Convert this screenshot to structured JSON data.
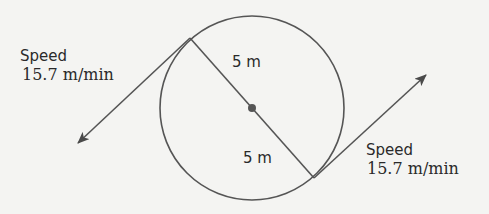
{
  "diagram": {
    "type": "circle-tangent-velocity",
    "circle": {
      "radius_label_top": "5 m",
      "radius_label_bottom": "5 m"
    },
    "left_velocity": {
      "title": "Speed",
      "value": "15.7 m/min"
    },
    "right_velocity": {
      "title": "Speed",
      "value": "15.7 m/min"
    },
    "colors": {
      "stroke": "#555555",
      "text": "#2a2a2a",
      "background": "#f4f4f2"
    }
  }
}
